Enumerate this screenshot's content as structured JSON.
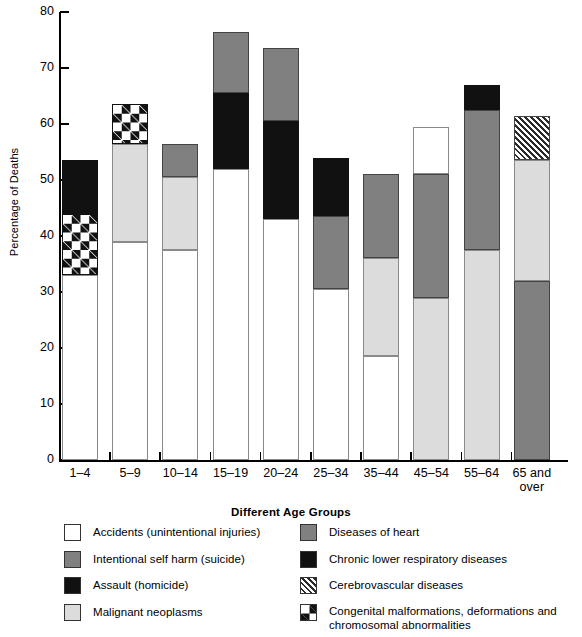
{
  "chart_data": {
    "type": "bar",
    "subtype": "stacked-bar",
    "title": "",
    "xlabel": "Different Age Groups",
    "ylabel": "Percentage of Deaths",
    "ylim": [
      0,
      80
    ],
    "ytick_step": 10,
    "yticks": [
      "80",
      "70",
      "60",
      "50",
      "40",
      "30",
      "20",
      "10",
      "0"
    ],
    "grid": false,
    "legend_position": "bottom",
    "categories": [
      "1–4",
      "5–9",
      "10–14",
      "15–19",
      "20–24",
      "25–34",
      "35–44",
      "45–54",
      "55–64",
      "65 and\nover"
    ],
    "series": [
      {
        "name": "Accidents (unintentional injuries)",
        "key": "accidents",
        "values": [
          33.0,
          39.0,
          37.5,
          52.0,
          43.0,
          30.5,
          18.5,
          8.5,
          0,
          0
        ]
      },
      {
        "name": "Intentional self harm (suicide)",
        "key": "suicide",
        "values": [
          0,
          0,
          6.0,
          11.0,
          13.0,
          13.0,
          15.0,
          0,
          0,
          0
        ]
      },
      {
        "name": "Assault (homicide)",
        "key": "homicide",
        "values": [
          0,
          0,
          0,
          13.5,
          17.5,
          10.5,
          0,
          0,
          0,
          0
        ]
      },
      {
        "name": "Malignant neoplasms",
        "key": "neoplasms",
        "values": [
          0,
          17.5,
          13.0,
          0,
          0,
          0,
          17.5,
          29.0,
          37.5,
          21.5
        ]
      },
      {
        "name": "Diseases of heart",
        "key": "heart",
        "values": [
          0,
          0,
          0,
          0,
          0,
          0,
          0,
          22.0,
          25.0,
          32.0
        ]
      },
      {
        "name": "Chronic lower respiratory diseases",
        "key": "respiratory",
        "values": [
          9.5,
          0,
          0,
          0,
          0,
          0,
          0,
          0,
          4.5,
          0
        ]
      },
      {
        "name": "Cerebrovascular diseases",
        "key": "cerebro",
        "values": [
          0,
          0,
          0,
          0,
          0,
          0,
          0,
          0,
          0,
          8.0
        ]
      },
      {
        "name": "Congenital malformations, deformations and chromosomal abnormalities",
        "key": "congenital",
        "values": [
          11.0,
          7.0,
          0,
          0,
          0,
          0,
          0,
          0,
          0,
          0
        ]
      }
    ],
    "bars": [
      {
        "category": "1–4",
        "total": 53.5,
        "segments": [
          {
            "key": "accidents",
            "from": 0,
            "to": 33.0
          },
          {
            "key": "congenital",
            "from": 33.0,
            "to": 44.0
          },
          {
            "key": "respiratory",
            "from": 44.0,
            "to": 53.5
          }
        ]
      },
      {
        "category": "5–9",
        "total": 63.5,
        "segments": [
          {
            "key": "accidents",
            "from": 0,
            "to": 39.0
          },
          {
            "key": "neoplasms",
            "from": 39.0,
            "to": 56.5
          },
          {
            "key": "congenital",
            "from": 56.5,
            "to": 63.5
          }
        ]
      },
      {
        "category": "10–14",
        "total": 56.5,
        "segments": [
          {
            "key": "accidents",
            "from": 0,
            "to": 37.5
          },
          {
            "key": "neoplasms",
            "from": 37.5,
            "to": 50.5
          },
          {
            "key": "suicide",
            "from": 50.5,
            "to": 56.5
          }
        ]
      },
      {
        "category": "15–19",
        "total": 76.5,
        "segments": [
          {
            "key": "accidents",
            "from": 0,
            "to": 52.0
          },
          {
            "key": "homicide",
            "from": 52.0,
            "to": 65.5
          },
          {
            "key": "suicide",
            "from": 65.5,
            "to": 76.5
          }
        ]
      },
      {
        "category": "20–24",
        "total": 73.5,
        "segments": [
          {
            "key": "accidents",
            "from": 0,
            "to": 43.0
          },
          {
            "key": "homicide",
            "from": 43.0,
            "to": 60.5
          },
          {
            "key": "suicide",
            "from": 60.5,
            "to": 73.5
          }
        ]
      },
      {
        "category": "25–34",
        "total": 54.0,
        "segments": [
          {
            "key": "accidents",
            "from": 0,
            "to": 30.5
          },
          {
            "key": "suicide",
            "from": 30.5,
            "to": 43.5
          },
          {
            "key": "homicide",
            "from": 43.5,
            "to": 54.0
          }
        ]
      },
      {
        "category": "35–44",
        "total": 51.0,
        "segments": [
          {
            "key": "accidents",
            "from": 0,
            "to": 18.5
          },
          {
            "key": "neoplasms",
            "from": 18.5,
            "to": 36.0
          },
          {
            "key": "heart",
            "from": 36.0,
            "to": 51.0
          }
        ]
      },
      {
        "category": "45–54",
        "total": 59.5,
        "segments": [
          {
            "key": "neoplasms",
            "from": 0,
            "to": 29.0
          },
          {
            "key": "heart",
            "from": 29.0,
            "to": 51.0
          },
          {
            "key": "accidents",
            "from": 51.0,
            "to": 59.5
          }
        ]
      },
      {
        "category": "55–64",
        "total": 67.0,
        "segments": [
          {
            "key": "neoplasms",
            "from": 0,
            "to": 37.5
          },
          {
            "key": "heart",
            "from": 37.5,
            "to": 62.5
          },
          {
            "key": "respiratory",
            "from": 62.5,
            "to": 67.0
          }
        ]
      },
      {
        "category": "65 and over",
        "total": 61.5,
        "segments": [
          {
            "key": "heart",
            "from": 0,
            "to": 32.0
          },
          {
            "key": "neoplasms",
            "from": 32.0,
            "to": 53.5
          },
          {
            "key": "cerebro",
            "from": 53.5,
            "to": 61.5
          }
        ]
      }
    ],
    "colors": {
      "accidents": "#ffffff",
      "suicide": "#808080",
      "homicide": "#111111",
      "neoplasms": "#dcdcdc",
      "heart": "#808080",
      "respiratory": "#111111",
      "cerebro": "#ffffff",
      "congenital": "#111111",
      "axis": "#000000"
    }
  },
  "legend": {
    "left_column": [
      {
        "key": "accidents",
        "label": "Accidents (unintentional injuries)"
      },
      {
        "key": "suicide",
        "label": "Intentional self harm (suicide)"
      },
      {
        "key": "homicide",
        "label": "Assault (homicide)"
      },
      {
        "key": "neoplasms",
        "label": "Malignant neoplasms"
      }
    ],
    "right_column": [
      {
        "key": "heart",
        "label": "Diseases of heart"
      },
      {
        "key": "respiratory",
        "label": "Chronic lower respiratory diseases"
      },
      {
        "key": "cerebro",
        "label": "Cerebrovascular diseases"
      },
      {
        "key": "congenital",
        "label": "Congenital malformations, deformations and\n   chromosomal abnormalities"
      }
    ]
  },
  "axes": {
    "y_title": "Percentage of Deaths",
    "x_title": "Different Age Groups",
    "y_labels": [
      "80",
      "70",
      "60",
      "50",
      "40",
      "30",
      "20",
      "10",
      "0"
    ],
    "x_labels": [
      "1–4",
      "5–9",
      "10–14",
      "15–19",
      "20–24",
      "25–34",
      "35–44",
      "45–54",
      "55–64",
      "65 and\nover"
    ]
  }
}
